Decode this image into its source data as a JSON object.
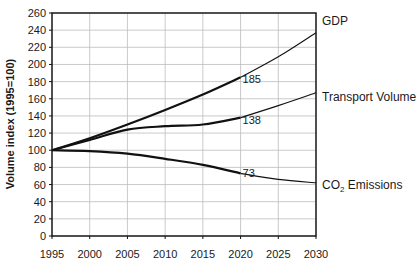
{
  "chart_data": {
    "type": "line",
    "title": "",
    "xlabel": "",
    "ylabel": "Volume index (1995=100)",
    "x": [
      1995,
      2000,
      2005,
      2010,
      2015,
      2020,
      2025,
      2030
    ],
    "xticks": [
      "1995",
      "2000",
      "2005",
      "2010",
      "2015",
      "2020",
      "2025",
      "2030"
    ],
    "yticks": [
      "0",
      "20",
      "40",
      "60",
      "80",
      "100",
      "120",
      "140",
      "160",
      "180",
      "200",
      "220",
      "240",
      "260"
    ],
    "xlim": [
      1995,
      2030
    ],
    "ylim": [
      0,
      260
    ],
    "grid": true,
    "legend_position": "inline-right",
    "series": [
      {
        "name": "GDP",
        "label": "GDP",
        "values": [
          100,
          114,
          130,
          147,
          165,
          185,
          209,
          237
        ],
        "stroke_width": 1.2,
        "bold_until": 2020
      },
      {
        "name": "Transport Volume",
        "label": "Transport Volume",
        "values": [
          100,
          112,
          124,
          128,
          130,
          138,
          152,
          167
        ],
        "stroke_width": 1.2,
        "bold_until": 2020
      },
      {
        "name": "CO2 Emissions",
        "label": "CO₂ Emissions",
        "values": [
          100,
          99,
          96,
          90,
          83,
          73,
          66,
          62
        ],
        "stroke_width": 1.2,
        "bold_until": 2020
      }
    ],
    "annotations": [
      {
        "series": "GDP",
        "x": 2020,
        "text": "185"
      },
      {
        "series": "Transport Volume",
        "x": 2020,
        "text": "138"
      },
      {
        "series": "CO2 Emissions",
        "x": 2020,
        "text": "73"
      }
    ]
  }
}
